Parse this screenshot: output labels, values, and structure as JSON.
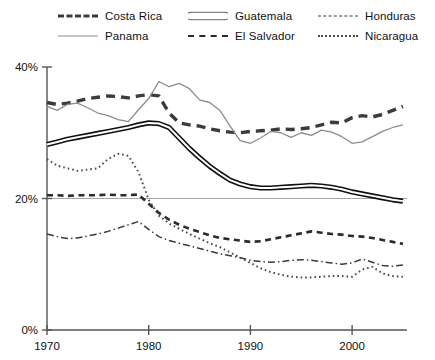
{
  "chart_data": {
    "type": "line",
    "title": "",
    "xlabel": "",
    "ylabel": "",
    "xlim": [
      1970,
      2005
    ],
    "ylim": [
      0,
      40
    ],
    "xticks": [
      1970,
      1980,
      1990,
      2000
    ],
    "xtick_labels": [
      "1970",
      "1980",
      "1990",
      "2000"
    ],
    "yticks": [
      0,
      20,
      40
    ],
    "ytick_labels": [
      "0%",
      "20%",
      "40%"
    ],
    "grid": "horizontal-at-20",
    "legend_position": "top",
    "x": [
      1970,
      1971,
      1972,
      1973,
      1974,
      1975,
      1976,
      1977,
      1978,
      1979,
      1980,
      1981,
      1982,
      1983,
      1984,
      1985,
      1986,
      1987,
      1988,
      1989,
      1990,
      1991,
      1992,
      1993,
      1994,
      1995,
      1996,
      1997,
      1998,
      1999,
      2000,
      2001,
      2002,
      2003,
      2004,
      2005
    ],
    "series": [
      {
        "name": "Costa Rica",
        "color": "#3b3b3b",
        "style": "thick-dashed",
        "values": [
          34.6,
          34.3,
          34.5,
          34.8,
          35.2,
          35.4,
          35.6,
          35.5,
          35.3,
          35.6,
          35.8,
          35.6,
          33.0,
          31.5,
          31.2,
          31.0,
          30.6,
          30.3,
          30.1,
          30.0,
          30.2,
          30.3,
          30.4,
          30.6,
          30.5,
          30.6,
          30.8,
          31.2,
          31.6,
          31.5,
          32.3,
          32.6,
          32.4,
          32.8,
          33.4,
          34.0
        ]
      },
      {
        "name": "Panama",
        "color": "#8c8c8c",
        "style": "thin-solid",
        "values": [
          34.0,
          33.4,
          34.3,
          34.5,
          33.8,
          33.0,
          32.6,
          32.0,
          31.7,
          33.5,
          35.2,
          37.8,
          37.0,
          37.5,
          36.7,
          35.0,
          34.6,
          33.4,
          31.0,
          28.8,
          28.4,
          29.2,
          30.2,
          30.0,
          29.3,
          30.0,
          29.6,
          30.4,
          30.1,
          29.4,
          28.4,
          28.6,
          29.4,
          30.2,
          30.8,
          31.2
        ]
      },
      {
        "name": "Guatemala",
        "color": "#111111",
        "style": "double-line",
        "values": [
          28.2,
          28.6,
          29.0,
          29.3,
          29.6,
          29.9,
          30.2,
          30.5,
          30.8,
          31.2,
          31.5,
          31.4,
          30.8,
          29.2,
          27.6,
          26.2,
          24.9,
          23.8,
          22.8,
          22.2,
          21.8,
          21.6,
          21.6,
          21.7,
          21.8,
          21.9,
          22.0,
          21.9,
          21.7,
          21.4,
          21.0,
          20.7,
          20.4,
          20.1,
          19.8,
          19.6
        ]
      },
      {
        "name": "El Salvador",
        "color": "#2b2b2b",
        "style": "dashed",
        "values": [
          20.5,
          20.5,
          20.4,
          20.5,
          20.5,
          20.5,
          20.6,
          20.5,
          20.5,
          20.6,
          19.2,
          17.8,
          16.8,
          16.0,
          15.4,
          14.9,
          14.4,
          14.0,
          13.8,
          13.6,
          13.4,
          13.5,
          13.8,
          14.1,
          14.4,
          14.7,
          15.0,
          14.8,
          14.6,
          14.5,
          14.3,
          14.2,
          14.0,
          13.7,
          13.4,
          13.1
        ]
      },
      {
        "name": "Honduras",
        "color": "#3a3a3a",
        "style": "dash-dot",
        "values": [
          14.6,
          14.2,
          13.9,
          14.0,
          14.3,
          14.6,
          15.0,
          15.5,
          16.0,
          16.5,
          15.3,
          14.2,
          13.6,
          13.2,
          12.8,
          12.4,
          12.0,
          11.6,
          11.3,
          11.0,
          10.6,
          10.4,
          10.3,
          10.4,
          10.6,
          10.7,
          10.6,
          10.4,
          10.2,
          10.0,
          10.2,
          10.8,
          10.3,
          9.8,
          9.7,
          9.9
        ]
      },
      {
        "name": "Nicaragua",
        "color": "#4a4a4a",
        "style": "dotted",
        "values": [
          26.0,
          25.0,
          24.6,
          24.2,
          24.4,
          24.6,
          26.0,
          26.8,
          26.5,
          24.0,
          19.8,
          17.4,
          16.2,
          15.4,
          14.6,
          13.9,
          13.2,
          12.6,
          11.8,
          11.0,
          10.2,
          9.4,
          8.8,
          8.4,
          8.1,
          8.0,
          8.0,
          8.1,
          8.2,
          8.2,
          8.1,
          9.2,
          9.6,
          8.6,
          8.2,
          8.1
        ]
      }
    ]
  },
  "legend": {
    "items": [
      {
        "label": "Costa Rica",
        "key": "costarica",
        "col": 0,
        "row": 0
      },
      {
        "label": "Panama",
        "key": "panama",
        "col": 0,
        "row": 1
      },
      {
        "label": "Guatemala",
        "key": "guatemala",
        "col": 1,
        "row": 0
      },
      {
        "label": "El Salvador",
        "key": "elsalvador",
        "col": 1,
        "row": 1
      },
      {
        "label": "Honduras",
        "key": "honduras",
        "col": 2,
        "row": 0
      },
      {
        "label": "Nicaragua",
        "key": "nicaragua",
        "col": 2,
        "row": 1
      }
    ]
  },
  "axes": {
    "y_labels": [
      "40%",
      "20%",
      "0%"
    ],
    "x_labels": [
      "1970",
      "1980",
      "1990",
      "2000"
    ]
  }
}
